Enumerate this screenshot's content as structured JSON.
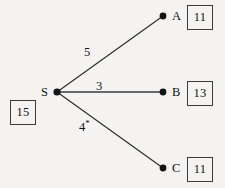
{
  "diagram": {
    "type": "node-link-graph",
    "background_color": "#f4f3f1",
    "line_color": "#333333",
    "source": {
      "letter": "S",
      "value": "15",
      "x": 57,
      "y": 92
    },
    "destinations": [
      {
        "id": "A",
        "letter": "A",
        "value": "11",
        "x": 163,
        "y": 16
      },
      {
        "id": "B",
        "letter": "B",
        "value": "13",
        "x": 163,
        "y": 92
      },
      {
        "id": "C",
        "letter": "C",
        "value": "11",
        "x": 163,
        "y": 168
      }
    ],
    "edges": [
      {
        "from": "S",
        "to": "A",
        "label": "5",
        "starred": false,
        "label_x": 84,
        "label_y": 46
      },
      {
        "from": "S",
        "to": "B",
        "label": "3",
        "starred": false,
        "label_x": 96,
        "label_y": 80
      },
      {
        "from": "S",
        "to": "C",
        "label": "4",
        "starred": true,
        "star": "*",
        "label_x": 79,
        "label_y": 121
      }
    ]
  }
}
